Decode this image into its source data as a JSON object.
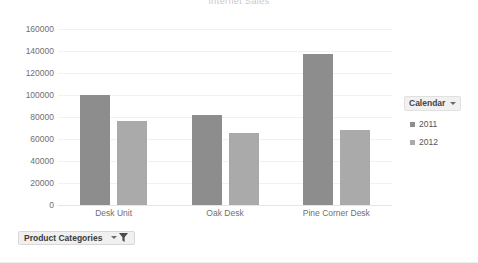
{
  "chart_data": {
    "type": "bar",
    "title": "Internet Sales",
    "xlabel": "",
    "ylabel": "",
    "ylim": [
      0,
      160000
    ],
    "ytick_step": 20000,
    "yticks": [
      "160000",
      "140000",
      "120000",
      "100000",
      "80000",
      "60000",
      "40000",
      "20000",
      "0"
    ],
    "grid": true,
    "legend_position": "right",
    "categories": [
      "Desk Unit",
      "Oak Desk",
      "Pine Corner Desk"
    ],
    "series": [
      {
        "name": "2011",
        "color": "#8d8d8d",
        "values": [
          100000,
          82000,
          137000
        ]
      },
      {
        "name": "2012",
        "color": "#aaaaaa",
        "values": [
          76000,
          65500,
          68000
        ]
      }
    ]
  },
  "legend": {
    "title": "Calendar",
    "dropdown_icon": "chevron-down-icon",
    "items": [
      {
        "label": "2011",
        "color": "#8d8d8d"
      },
      {
        "label": "2012",
        "color": "#aaaaaa"
      }
    ]
  },
  "slicer": {
    "label": "Product Categories",
    "dropdown_icon": "chevron-down-icon",
    "filter_icon": "funnel-icon"
  }
}
